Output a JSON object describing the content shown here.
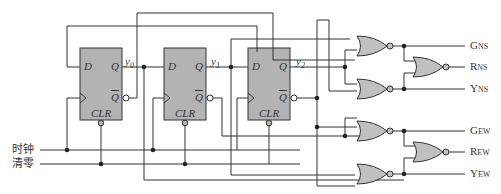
{
  "inputs": {
    "clock": "时钟",
    "clear": "清零"
  },
  "flipflops": [
    {
      "d": "D",
      "q": "Q",
      "qbar": "Q",
      "clr": "CLR",
      "out": "y",
      "sub": "0"
    },
    {
      "d": "D",
      "q": "Q",
      "qbar": "Q",
      "clr": "CLR",
      "out": "y",
      "sub": "1"
    },
    {
      "d": "D",
      "q": "Q",
      "qbar": "Q",
      "clr": "CLR",
      "out": "y",
      "sub": "2"
    }
  ],
  "outputs": [
    {
      "main": "G",
      "sub": "NS"
    },
    {
      "main": "R",
      "sub": "NS"
    },
    {
      "main": "Y",
      "sub": "NS"
    },
    {
      "main": "G",
      "sub": "EW"
    },
    {
      "main": "R",
      "sub": "EW"
    },
    {
      "main": "Y",
      "sub": "EW"
    }
  ],
  "colors": {
    "wire": "#333333",
    "block_fill": "#b3b3b3",
    "gate_fill": "#c0c0c0"
  }
}
